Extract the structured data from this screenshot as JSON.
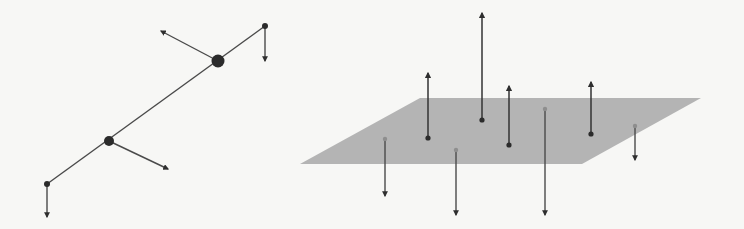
{
  "figure": {
    "colors": {
      "background": "#f7f7f5",
      "line": "#4a4a4a",
      "node": "#2b2b2b",
      "plane": "#b4b4b4",
      "below_point": "#8e8e8e"
    }
  },
  "left_diagram": {
    "line": {
      "x1": 47,
      "y1": 184,
      "x2": 265,
      "y2": 26
    },
    "nodes": [
      {
        "name": "end-bottom",
        "cx": 47,
        "cy": 184,
        "r": 3
      },
      {
        "name": "end-top",
        "cx": 265,
        "cy": 26,
        "r": 3
      },
      {
        "name": "mid-lower",
        "cx": 109,
        "cy": 141,
        "r": 5
      },
      {
        "name": "mid-upper",
        "cx": 218,
        "cy": 61,
        "r": 6.5
      }
    ],
    "arrows": [
      {
        "x1": 47,
        "y1": 184,
        "x2": 47,
        "y2": 217
      },
      {
        "x1": 265,
        "y1": 26,
        "x2": 265,
        "y2": 61
      },
      {
        "x1": 218,
        "y1": 61,
        "x2": 161,
        "y2": 31
      },
      {
        "x1": 109,
        "y1": 141,
        "x2": 168,
        "y2": 169
      }
    ]
  },
  "right_diagram": {
    "plane": {
      "points": "300,164 420,98 701,98 582,164"
    },
    "up_vectors": [
      {
        "x": 428,
        "y_base": 138,
        "y_tip": 73
      },
      {
        "x": 482,
        "y_base": 120,
        "y_tip": 13
      },
      {
        "x": 509,
        "y_base": 145,
        "y_tip": 86
      },
      {
        "x": 591,
        "y_base": 134,
        "y_tip": 82
      }
    ],
    "down_vectors": [
      {
        "x": 385,
        "y_base": 139,
        "y_tip": 196
      },
      {
        "x": 456,
        "y_base": 150,
        "y_tip": 215
      },
      {
        "x": 545,
        "y_base": 109,
        "y_tip": 215
      },
      {
        "x": 635,
        "y_base": 126,
        "y_tip": 160
      }
    ]
  }
}
